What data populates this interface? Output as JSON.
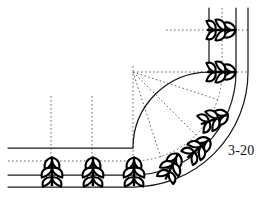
{
  "figure": {
    "label": "3-20",
    "background_color": "#ffffff",
    "line_color": "#1a1a1a",
    "dotted_color": "#555555",
    "plant_color": "#000000",
    "width": 268,
    "height": 208
  },
  "geometry": {
    "curve_center": {
      "x": 133,
      "y": 72
    },
    "radii": {
      "inner": 76,
      "middle": 103,
      "outer": 115
    },
    "horizontal_band_lines_y": [
      148,
      175,
      187
    ],
    "vertical_band_lines_x": [
      209,
      236,
      248
    ],
    "horizontal_band_left_x": 8,
    "vertical_band_top_y": 8
  },
  "construction_lines": {
    "vertical_dotted_x": [
      51,
      92,
      133
    ],
    "vertical_dotted_y_start": 96,
    "vertical_dotted_y_end": 186,
    "horizontal_dotted_y": [
      30,
      72
    ],
    "horizontal_dotted_x_start": [
      166,
      133
    ],
    "horizontal_dotted_x_end": [
      248,
      248
    ],
    "radial_rays_deg": [
      18,
      45,
      72
    ],
    "dotted_arc_radius": 89
  },
  "plants": {
    "symbol_name": "plant-shrub-symbol",
    "leaf_pairs": 3,
    "straight_row": [
      {
        "x": 52,
        "y": 172,
        "rotation": 0
      },
      {
        "x": 93,
        "y": 172,
        "rotation": 0
      },
      {
        "x": 134,
        "y": 172,
        "rotation": 0
      }
    ],
    "curved_row": [
      {
        "x": 175,
        "y": 166,
        "rotation": 22
      },
      {
        "x": 201,
        "y": 145,
        "rotation": 46
      },
      {
        "x": 217,
        "y": 116,
        "rotation": 66
      },
      {
        "x": 223,
        "y": 72,
        "rotation": 90
      },
      {
        "x": 223,
        "y": 30,
        "rotation": 90
      }
    ]
  }
}
